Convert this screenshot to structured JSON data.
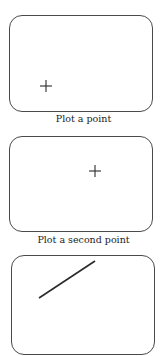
{
  "panels": [
    {
      "caption": "Plot a point",
      "marker": {
        "type": "plus",
        "x": 36,
        "y": 85
      }
    },
    {
      "caption": "Plot a second point",
      "marker": {
        "type": "plus",
        "x": 94,
        "y": 56
      }
    },
    {
      "caption": "",
      "line": {
        "x1": 39,
        "y1": 97,
        "x2": 93,
        "y2": 60
      }
    }
  ],
  "colors": {
    "stroke": "#2a2a2a",
    "border": "#4a4a4a"
  }
}
